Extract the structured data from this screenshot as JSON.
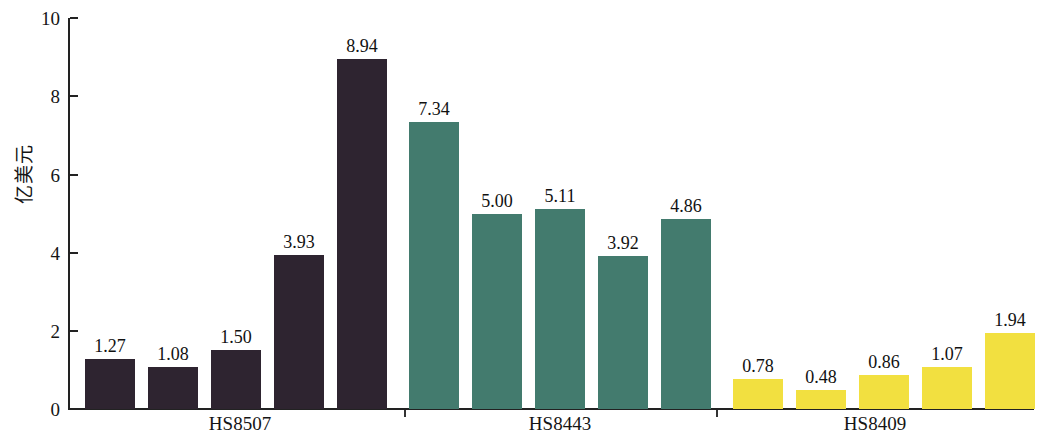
{
  "chart_data": {
    "type": "bar",
    "title": "",
    "subtitle": "",
    "xlabel": "",
    "ylabel": "亿美元",
    "ylim": [
      0,
      10
    ],
    "ytick_labels": [
      "0",
      "2",
      "4",
      "6",
      "8",
      "10"
    ],
    "ytick_values": [
      0,
      2,
      4,
      6,
      8,
      10
    ],
    "grid": false,
    "legend": "none",
    "categories": [
      "HS8507",
      "HS8443",
      "HS8409"
    ],
    "groups": [
      {
        "name": "HS8507",
        "color": "#2e2430",
        "values": [
          1.27,
          1.08,
          1.5,
          3.93,
          8.94
        ],
        "labels": [
          "1.27",
          "1.08",
          "1.50",
          "3.93",
          "8.94"
        ]
      },
      {
        "name": "HS8443",
        "color": "#437b6e",
        "values": [
          7.34,
          5.0,
          5.11,
          3.92,
          4.86
        ],
        "labels": [
          "7.34",
          "5.00",
          "5.11",
          "3.92",
          "4.86"
        ]
      },
      {
        "name": "HS8409",
        "color": "#f2e040",
        "values": [
          0.78,
          0.48,
          0.86,
          1.07,
          1.94
        ],
        "labels": [
          "0.78",
          "0.48",
          "0.86",
          "1.07",
          "1.94"
        ]
      }
    ],
    "colors": {
      "group1": "#2e2430",
      "group2": "#437b6e",
      "group3": "#f2e040",
      "axis": "#222222",
      "text": "#151515",
      "background": "#ffffff"
    }
  },
  "axis": {
    "y_label": "亿美元",
    "ticks": [
      "10",
      "8",
      "6",
      "4",
      "2",
      "0"
    ]
  },
  "group_labels": [
    "HS8507",
    "HS8443",
    "HS8409"
  ]
}
